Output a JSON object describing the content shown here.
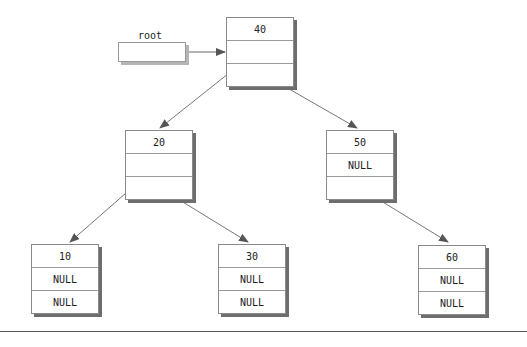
{
  "diagram": {
    "type": "binary-search-tree",
    "root_pointer": {
      "label": "root",
      "points_to": "40"
    },
    "nodes": [
      {
        "id": "40",
        "fields": [
          "40",
          "",
          ""
        ]
      },
      {
        "id": "20",
        "fields": [
          "20",
          "",
          ""
        ]
      },
      {
        "id": "50",
        "fields": [
          "50",
          "NULL",
          ""
        ]
      },
      {
        "id": "10",
        "fields": [
          "10",
          "NULL",
          "NULL"
        ]
      },
      {
        "id": "30",
        "fields": [
          "30",
          "NULL",
          "NULL"
        ]
      },
      {
        "id": "60",
        "fields": [
          "60",
          "NULL",
          "NULL"
        ]
      }
    ],
    "edges": [
      {
        "from": "root",
        "to": "40"
      },
      {
        "from": "40",
        "to": "20",
        "side": "left"
      },
      {
        "from": "40",
        "to": "50",
        "side": "right"
      },
      {
        "from": "20",
        "to": "10",
        "side": "left"
      },
      {
        "from": "20",
        "to": "30",
        "side": "right"
      },
      {
        "from": "50",
        "to": "60",
        "side": "right"
      }
    ]
  }
}
